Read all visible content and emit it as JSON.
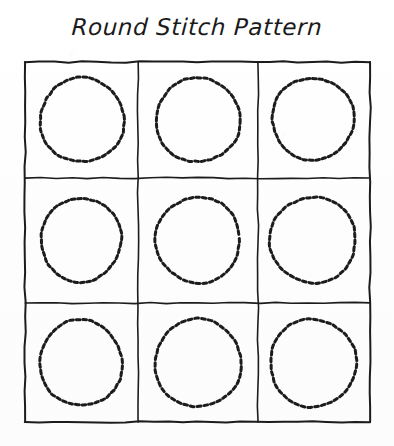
{
  "page": {
    "title": "Round Stitch Pattern",
    "background_color": "#fefefe",
    "ink_color": "#1a1a1a",
    "width": 394,
    "height": 446
  },
  "figure": {
    "style": "hand-drawn sketch",
    "title": "Round Stitch Pattern",
    "grid": {
      "rows": 3,
      "columns": 3,
      "outer_box": {
        "x": 25,
        "y": 62,
        "width": 345,
        "height": 360
      },
      "vertical_divider_x": [
        138,
        258
      ],
      "horizontal_divider_y": [
        178,
        303
      ],
      "line_color": "#1c1c1c",
      "line_width": 2
    },
    "motif": {
      "shape": "dashed-circle",
      "stroke_color": "#1c1c1c",
      "stroke_width": 3,
      "dash_count": 20,
      "dash_pattern": "8 6"
    },
    "cells": [
      {
        "row": 1,
        "column": 1,
        "shape": "dashed-circle",
        "cx": 82,
        "cy": 120,
        "rx": 42,
        "ry": 42,
        "rotation": -6
      },
      {
        "row": 1,
        "column": 2,
        "shape": "dashed-circle",
        "cx": 198,
        "cy": 120,
        "rx": 42,
        "ry": 42,
        "rotation": 4
      },
      {
        "row": 1,
        "column": 3,
        "shape": "dashed-circle",
        "cx": 313,
        "cy": 119,
        "rx": 41,
        "ry": 41,
        "rotation": -10
      },
      {
        "row": 2,
        "column": 1,
        "shape": "dashed-circle",
        "cx": 81,
        "cy": 240,
        "rx": 40,
        "ry": 42,
        "rotation": 8
      },
      {
        "row": 2,
        "column": 2,
        "shape": "dashed-circle",
        "cx": 198,
        "cy": 240,
        "rx": 42,
        "ry": 43,
        "rotation": -4
      },
      {
        "row": 2,
        "column": 3,
        "shape": "dashed-circle",
        "cx": 313,
        "cy": 240,
        "rx": 43,
        "ry": 43,
        "rotation": 12
      },
      {
        "row": 3,
        "column": 1,
        "shape": "dashed-circle",
        "cx": 81,
        "cy": 363,
        "rx": 41,
        "ry": 43,
        "rotation": -8
      },
      {
        "row": 3,
        "column": 2,
        "shape": "dashed-circle",
        "cx": 198,
        "cy": 363,
        "rx": 43,
        "ry": 44,
        "rotation": 6
      },
      {
        "row": 3,
        "column": 3,
        "shape": "dashed-circle",
        "cx": 313,
        "cy": 363,
        "rx": 43,
        "ry": 44,
        "rotation": -3
      }
    ]
  }
}
